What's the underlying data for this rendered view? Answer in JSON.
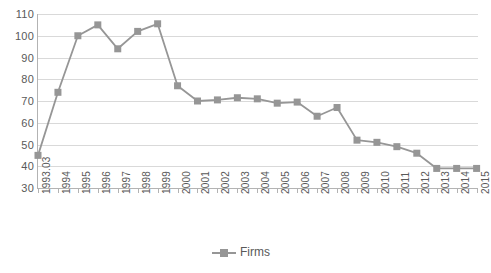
{
  "chart_data": {
    "type": "line",
    "title": "",
    "subtitle": "",
    "xlabel": "",
    "ylabel": "",
    "ylim": [
      30,
      110
    ],
    "ytick_step": 10,
    "yticks": [
      110,
      100,
      90,
      80,
      70,
      60,
      50,
      40,
      30
    ],
    "grid": true,
    "legend_position": "bottom",
    "categories": [
      "1993.03",
      "1994",
      "1995",
      "1996",
      "1997",
      "1998",
      "1999",
      "2000",
      "2001",
      "2002",
      "2003",
      "2004",
      "2005",
      "2006",
      "2007",
      "2008",
      "2009",
      "2010",
      "2011",
      "2012",
      "2013",
      "2014",
      "2015"
    ],
    "series": [
      {
        "name": "Firms",
        "color": "#969696",
        "marker": "square",
        "values": [
          45,
          74,
          100,
          105,
          94,
          102,
          105.5,
          77,
          70,
          70.5,
          71.5,
          71,
          69,
          69.5,
          63,
          67,
          52,
          51,
          49,
          46,
          39,
          39,
          39
        ]
      }
    ]
  },
  "legend": {
    "entries": [
      {
        "label": "Firms"
      }
    ]
  },
  "colors": {
    "series": "#969696",
    "gridline": "#d9d9d9",
    "axis": "#b3b3b3",
    "text": "#595959",
    "background": "#ffffff"
  }
}
